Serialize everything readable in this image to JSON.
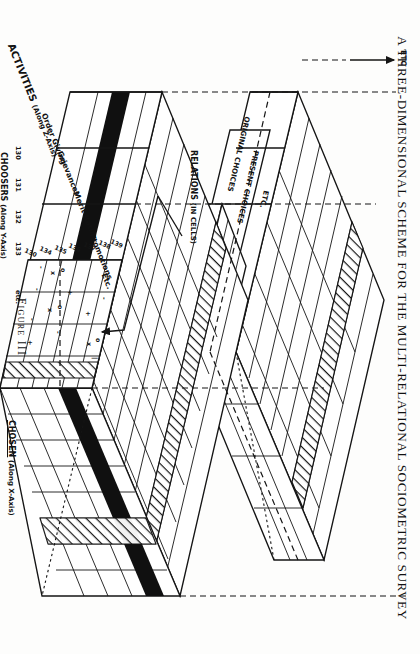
{
  "figure": {
    "title": "A THREE-DIMENSIONAL SCHEME FOR THE MULTI-RELATIONAL SOCIOMETRIC SURVEY",
    "caption": "Figure III",
    "type": "diagram",
    "subtype": "isometric-3d-matrix-blocks"
  },
  "axes": {
    "x": {
      "label": "CHOSEN",
      "qualifier": "(Along X-Axis)",
      "arrow_symbol": "x",
      "arrow_direction": "right"
    },
    "y": {
      "label": "CHOOSERS",
      "qualifier": "(Along Y-Axis)",
      "arrow_symbol": "n",
      "arrow_direction": "right"
    },
    "z": {
      "label": "ACTIVITIES",
      "qualifier": "(Along Z-Axis)"
    },
    "w": {
      "label": "RELATIONS",
      "qualifier": "(IN CELLS)"
    },
    "stack": {
      "label": "ETC",
      "arrow_direction": "up"
    }
  },
  "activities": [
    {
      "label": "Order Giving"
    },
    {
      "label": "Grievances"
    },
    {
      "label": "Merit Rating"
    },
    {
      "label": "Promotions"
    },
    {
      "label": "Etc."
    }
  ],
  "relation_layers": [
    {
      "label": "ORIGINAL CHOICES"
    },
    {
      "label": "PRESENT CHOICES"
    },
    {
      "label": "ETC."
    }
  ],
  "y_axis_ticks": [
    "130",
    "131",
    "132",
    "133",
    "etc."
  ],
  "x_axis_ticks": [
    "130",
    "131",
    "132",
    "133",
    "134",
    "135",
    "136",
    "137",
    "138"
  ],
  "cell_symbols": [
    "+",
    "-",
    "o",
    "x"
  ],
  "cell_detail": {
    "note": "callout arrow points from the cut-away cell into the enlarged matrix face",
    "marks": [
      {
        "row": 0,
        "col": 3,
        "sym": "o"
      },
      {
        "row": 0,
        "col": 3,
        "sym": "x"
      },
      {
        "row": 0,
        "col": 4,
        "sym": "|"
      },
      {
        "row": 0,
        "col": 1,
        "sym": "-"
      },
      {
        "row": 1,
        "col": 2,
        "sym": "+"
      },
      {
        "row": 2,
        "col": 1,
        "sym": "+"
      },
      {
        "row": 3,
        "col": 0,
        "sym": "o"
      },
      {
        "row": 3,
        "col": 0,
        "sym": "x"
      },
      {
        "row": 3,
        "col": 2,
        "sym": "o"
      },
      {
        "row": 3,
        "col": 2,
        "sym": "x"
      },
      {
        "row": 3,
        "col": 3,
        "sym": "-"
      },
      {
        "row": 4,
        "col": 0,
        "sym": "-"
      },
      {
        "row": 4,
        "col": 1,
        "sym": "-"
      },
      {
        "row": 4,
        "col": 2,
        "sym": "-"
      },
      {
        "row": 4,
        "col": 3,
        "sym": "+"
      }
    ]
  },
  "colors": {
    "ink": "#151515",
    "paper": "#fdfdfc",
    "solid_band": "#101010",
    "hatch": "#151515"
  }
}
